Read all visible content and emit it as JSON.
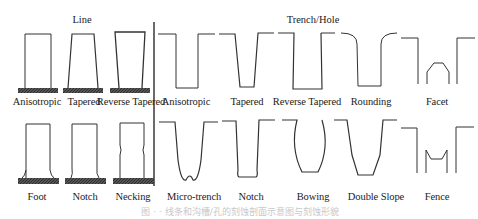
{
  "headers": {
    "line": "Line",
    "trench": "Trench/Hole"
  },
  "line_profiles": {
    "row1": [
      {
        "label": "Anisotropic"
      },
      {
        "label": "Tapered"
      },
      {
        "label": "Reverse Tapered"
      }
    ],
    "row2": [
      {
        "label": "Foot"
      },
      {
        "label": "Notch"
      },
      {
        "label": "Necking"
      }
    ]
  },
  "trench_profiles": {
    "row1": [
      {
        "label": "Anisotropic"
      },
      {
        "label": "Tapered"
      },
      {
        "label": "Reverse Tapered"
      },
      {
        "label": "Rounding"
      },
      {
        "label": "Facet"
      }
    ],
    "row2": [
      {
        "label": "Micro-trench"
      },
      {
        "label": "Notch"
      },
      {
        "label": "Bowing"
      },
      {
        "label": "Double Slope"
      },
      {
        "label": "Fence"
      }
    ]
  },
  "caption": "图 · · 线条和沟槽/孔的刻蚀剖面示意图与刻蚀形貌"
}
